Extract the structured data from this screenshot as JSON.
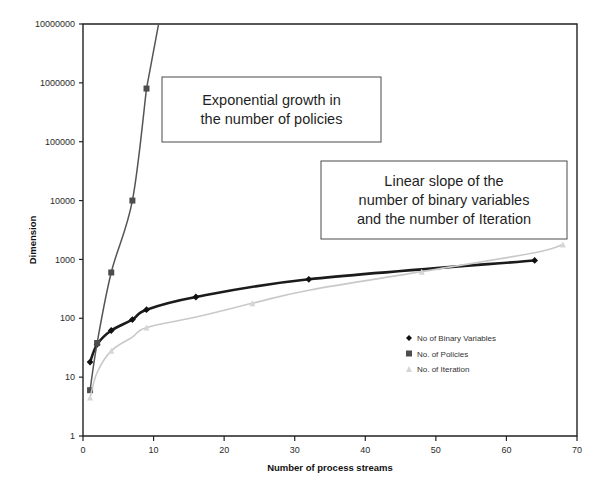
{
  "chart_data": {
    "type": "line",
    "title": "",
    "xlabel": "Number of process streams",
    "ylabel": "Dimension",
    "xlim": [
      0,
      70
    ],
    "ylim": [
      1,
      10000000
    ],
    "yscale": "log",
    "grid": false,
    "legend_position": "inside-right",
    "xticks": [
      "0",
      "10",
      "20",
      "30",
      "40",
      "50",
      "60",
      "70"
    ],
    "xtick_values": [
      0,
      10,
      20,
      30,
      40,
      50,
      60,
      70
    ],
    "yticks": [
      "1",
      "10",
      "100",
      "1000",
      "10000",
      "100000",
      "1000000",
      "10000000"
    ],
    "ytick_values": [
      1,
      10,
      100,
      1000,
      10000,
      100000,
      1000000,
      10000000
    ],
    "series": [
      {
        "name": "No of Binary Variables",
        "marker": "diamond",
        "color": "#111111",
        "x": [
          1,
          2,
          4,
          7,
          9,
          16,
          32,
          64
        ],
        "values": [
          18,
          36,
          62,
          95,
          140,
          230,
          460,
          960
        ]
      },
      {
        "name": "No. of Policies",
        "marker": "square",
        "color": "#4d4d4d",
        "x": [
          1,
          2,
          4,
          7,
          9
        ],
        "values": [
          6,
          38,
          600,
          10000,
          800000
        ]
      },
      {
        "name": "No. of Iteration",
        "marker": "triangle",
        "color": "#d5d5d5",
        "x": [
          1,
          2,
          4,
          7,
          9,
          16,
          24,
          32,
          48,
          64,
          68
        ],
        "values": [
          4.5,
          12,
          28,
          48,
          70,
          105,
          180,
          300,
          620,
          1300,
          1800
        ]
      }
    ],
    "annotations": [
      {
        "id": "exponential-growth",
        "lines": [
          "Exponential growth in",
          "the number of policies"
        ],
        "box": {
          "x": 162,
          "y": 77,
          "width": 219,
          "height": 65
        }
      },
      {
        "id": "linear-slope",
        "lines": [
          "Linear slope of the",
          "number of binary variables",
          "and the number of Iteration"
        ],
        "box": {
          "x": 321,
          "y": 161,
          "width": 246,
          "height": 78
        }
      }
    ],
    "colors": {
      "binary_variables": "#111111",
      "policies": "#4d4d4d",
      "iteration": "#d5d5d5",
      "axis": "#222222",
      "background": "#ffffff"
    }
  },
  "legend": {
    "items": [
      {
        "label": "No of Binary Variables",
        "marker": "diamond-marker"
      },
      {
        "label": "No. of Policies",
        "marker": "square-marker"
      },
      {
        "label": "No. of Iteration",
        "marker": "triangle-marker"
      }
    ]
  }
}
